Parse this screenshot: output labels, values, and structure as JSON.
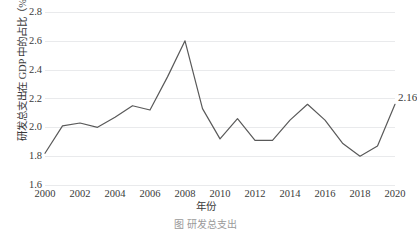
{
  "chart_data": {
    "type": "line",
    "title": "",
    "xlabel": "年份",
    "ylabel": "研发总支出在 GDP 中的占比（%）",
    "xlim": [
      2000,
      2020
    ],
    "ylim": [
      1.6,
      2.8
    ],
    "grid": true,
    "legend": "none",
    "line_color": "#595959",
    "gridline_color": "#e9eaec",
    "x": [
      2000,
      2001,
      2002,
      2003,
      2004,
      2005,
      2006,
      2007,
      2008,
      2009,
      2010,
      2011,
      2012,
      2013,
      2014,
      2015,
      2016,
      2017,
      2018,
      2019,
      2020
    ],
    "values": [
      1.82,
      2.01,
      2.03,
      2.0,
      2.07,
      2.15,
      2.12,
      2.35,
      2.6,
      2.13,
      1.92,
      2.06,
      1.91,
      1.91,
      2.05,
      2.16,
      2.05,
      1.89,
      1.8,
      1.87,
      2.16
    ],
    "y_ticks": [
      "2.8",
      "2.6",
      "2.4",
      "2.2",
      "2.0",
      "1.8",
      "1.6"
    ],
    "y_tick_values": [
      2.8,
      2.6,
      2.4,
      2.2,
      2.0,
      1.8,
      1.6
    ],
    "x_ticks": [
      "2000",
      "2002",
      "2004",
      "2006",
      "2008",
      "2010",
      "2012",
      "2014",
      "2016",
      "2018",
      "2020"
    ],
    "x_tick_values": [
      2000,
      2002,
      2004,
      2006,
      2008,
      2010,
      2012,
      2014,
      2016,
      2018,
      2020
    ],
    "annotations": [
      {
        "label": "2.16",
        "x": 2020,
        "y": 2.16
      }
    ]
  },
  "caption": "图    研发总支出"
}
